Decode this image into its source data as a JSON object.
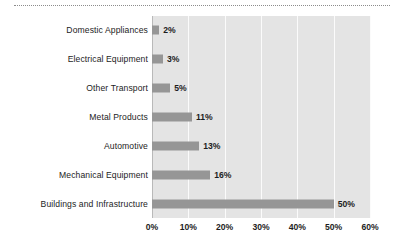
{
  "chart_data": {
    "type": "bar",
    "orientation": "horizontal",
    "title": "",
    "xlabel": "",
    "ylabel": "",
    "xlim": [
      0,
      60
    ],
    "xticks": [
      "0%",
      "10%",
      "20%",
      "30%",
      "40%",
      "50%",
      "60%"
    ],
    "xtick_values": [
      0,
      10,
      20,
      30,
      40,
      50,
      60
    ],
    "grid": true,
    "legend": null,
    "categories": [
      "Domestic Appliances",
      "Electrical Equipment",
      "Other Transport",
      "Metal Products",
      "Automotive",
      "Mechanical Equipment",
      "Buildings and Infrastructure"
    ],
    "values": [
      2,
      3,
      5,
      11,
      13,
      16,
      50
    ],
    "data_labels": [
      "2%",
      "3%",
      "5%",
      "11%",
      "13%",
      "16%",
      "50%"
    ],
    "bar_color": "#969696",
    "plot_background": "#e4e4e4",
    "gridline_color": "#fbfbfb",
    "axis_color": "#b9b9b9"
  },
  "decor": {
    "top_rule": "dotted-divider"
  }
}
